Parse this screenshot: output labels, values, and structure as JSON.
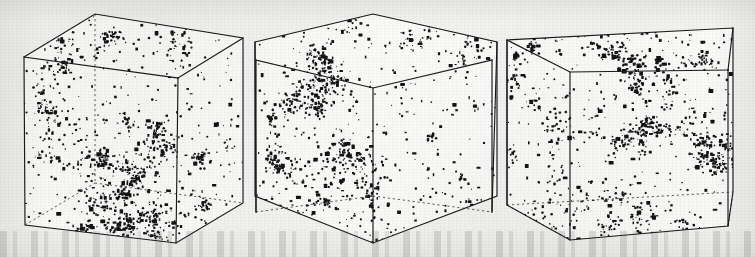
{
  "figure": {
    "background_color": "#f3f3f2",
    "ink_color": "#141414",
    "edge_color": "#1a1a1a",
    "hidden_edge_color": "#4a4a4a",
    "width": 755,
    "height": 257,
    "media": "scanned halftone print on aged paper",
    "caption": ""
  },
  "chart_data": {
    "type": "scatter",
    "subtitle": "",
    "xlabel": "",
    "ylabel": "",
    "zlabel": "",
    "grid": false,
    "legend": "none",
    "axis_ranges": {
      "x": [
        0,
        1
      ],
      "y": [
        0,
        1
      ],
      "z": [
        0,
        1
      ]
    },
    "projection": "3d-wireframe-cube",
    "marker": {
      "shape": "irregular-dot",
      "color": "#141414",
      "size_px_min": 1,
      "size_px_max": 4
    },
    "panels": [
      {
        "index": 1,
        "label": "",
        "n_points": 1150,
        "view": "left-oblique",
        "cube_projection": {
          "front_top_left": [
            24,
            57
          ],
          "front_top_right": [
            178,
            78
          ],
          "front_bottom_left": [
            25,
            225
          ],
          "front_bottom_right": [
            176,
            243
          ],
          "back_top_left": [
            95,
            14
          ],
          "back_top_right": [
            243,
            38
          ],
          "back_bottom_left": [
            95,
            183
          ],
          "back_bottom_right": [
            243,
            203
          ]
        },
        "hidden_edges": [
          "back_bottom_left-back_bottom_right",
          "front_bottom_left-back_bottom_left",
          "back_bottom_right-front_bottom_right",
          "back_top_left-back_bottom_left"
        ],
        "structure_note": "clustered filamentary cosmic-web pattern with voids"
      },
      {
        "index": 2,
        "label": "",
        "n_points": 1200,
        "view": "near-face-on / centred",
        "cube_projection": {
          "front_top_left": [
            256,
            60
          ],
          "front_top_right": [
            492,
            60
          ],
          "front_bottom_left": [
            256,
            212
          ],
          "front_bottom_right": [
            492,
            212
          ],
          "back_top_left": [
            255,
            42
          ],
          "back_top_right": [
            497,
            42
          ],
          "back_bottom_left": [
            255,
            196
          ],
          "back_bottom_right": [
            497,
            196
          ],
          "apex_top": [
            373,
            14
          ],
          "apex_bottom": [
            373,
            243
          ]
        },
        "hidden_edges": [
          "left-bottom-diagonal",
          "right-bottom-diagonal"
        ],
        "structure_note": "dense central ridge crossing, symmetric projection"
      },
      {
        "index": 3,
        "label": "",
        "n_points": 1180,
        "view": "right-oblique",
        "cube_projection": {
          "front_top_left": [
            508,
            72
          ],
          "front_top_right": [
            728,
            70
          ],
          "front_bottom_left": [
            570,
            240
          ],
          "front_bottom_right": [
            728,
            226
          ],
          "back_top_left": [
            507,
            40
          ],
          "back_top_right": [
            733,
            28
          ],
          "back_bottom_left": [
            507,
            205
          ],
          "back_bottom_right": [
            733,
            192
          ]
        },
        "hidden_edges": [
          "back_bottom_left-front_bottom_left",
          "front_bottom_right-back_bottom_right",
          "back_top_left-back_bottom_left"
        ],
        "structure_note": "strong cluster concentration in upper-left and lower-centre"
      }
    ]
  }
}
